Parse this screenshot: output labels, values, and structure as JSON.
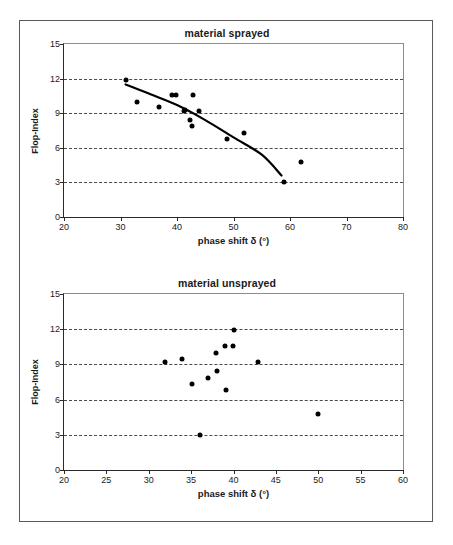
{
  "figure": {
    "charts": [
      {
        "id": "material-sprayed",
        "title": "material sprayed",
        "xlabel": "phase shift δ (°)",
        "ylabel": "Flop-Index",
        "xlim": [
          20,
          80
        ],
        "ylim": [
          0,
          15
        ],
        "xticks": [
          "20",
          "30",
          "40",
          "50",
          "60",
          "70",
          "80"
        ],
        "xtick_values": [
          20,
          30,
          40,
          50,
          60,
          70,
          80
        ],
        "yticks": [
          "0",
          "3",
          "6",
          "9",
          "12",
          "15"
        ],
        "ytick_values": [
          0,
          3,
          6,
          9,
          12,
          15
        ],
        "gridlines": [
          3,
          6,
          9,
          12
        ],
        "grid": "horizontal-dashed",
        "legend": "none",
        "points": [
          [
            30.9,
            11.9
          ],
          [
            33.0,
            9.95
          ],
          [
            36.9,
            9.5
          ],
          [
            39.1,
            10.6
          ],
          [
            39.9,
            10.55
          ],
          [
            41.2,
            9.2
          ],
          [
            41.4,
            9.25
          ],
          [
            42.3,
            8.4
          ],
          [
            42.7,
            7.85
          ],
          [
            42.9,
            10.55
          ],
          [
            43.9,
            9.2
          ],
          [
            48.9,
            6.8
          ],
          [
            51.9,
            7.3
          ],
          [
            59.0,
            3.0
          ],
          [
            61.9,
            4.75
          ]
        ],
        "trend": {
          "type": "fitted-curve",
          "points": [
            [
              30.9,
              11.5
            ],
            [
              35.0,
              10.7
            ],
            [
              40.0,
              9.7
            ],
            [
              45.0,
              8.4
            ],
            [
              50.0,
              6.9
            ],
            [
              55.0,
              5.4
            ],
            [
              58.5,
              3.6
            ]
          ]
        }
      },
      {
        "id": "material-unsprayed",
        "title": "material unsprayed",
        "xlabel": "phase shift δ (°)",
        "ylabel": "Flop-Index",
        "xlim": [
          20,
          60
        ],
        "ylim": [
          0,
          15
        ],
        "xticks": [
          "20",
          "25",
          "30",
          "35",
          "40",
          "45",
          "50",
          "55",
          "60"
        ],
        "xtick_values": [
          20,
          25,
          30,
          35,
          40,
          45,
          50,
          55,
          60
        ],
        "yticks": [
          "0",
          "3",
          "6",
          "9",
          "12",
          "15"
        ],
        "ytick_values": [
          0,
          3,
          6,
          9,
          12,
          15
        ],
        "gridlines": [
          3,
          6,
          9,
          12
        ],
        "grid": "horizontal-dashed",
        "legend": "none",
        "points": [
          [
            31.9,
            9.2
          ],
          [
            33.9,
            9.5
          ],
          [
            35.1,
            7.35
          ],
          [
            36.0,
            3.0
          ],
          [
            37.0,
            7.85
          ],
          [
            37.9,
            9.95
          ],
          [
            38.1,
            8.4
          ],
          [
            39.0,
            10.6
          ],
          [
            39.1,
            6.8
          ],
          [
            39.9,
            10.55
          ],
          [
            40.0,
            11.9
          ],
          [
            42.9,
            9.2
          ],
          [
            50.0,
            4.75
          ]
        ],
        "trend": null
      }
    ]
  },
  "chart_data": [
    {
      "type": "scatter",
      "title": "material sprayed",
      "xlabel": "phase shift δ (°)",
      "ylabel": "Flop-Index",
      "xlim": [
        20,
        80
      ],
      "ylim": [
        0,
        15
      ],
      "xticks": [
        20,
        30,
        40,
        50,
        60,
        70,
        80
      ],
      "yticks": [
        0,
        3,
        6,
        9,
        12,
        15
      ],
      "grid": "horizontal dashed at 3,6,9,12",
      "legend": "none",
      "series": [
        {
          "name": "sprayed samples",
          "x": [
            30.9,
            33.0,
            36.9,
            39.1,
            39.9,
            41.2,
            41.4,
            42.3,
            42.7,
            42.9,
            43.9,
            48.9,
            51.9,
            59.0,
            61.9
          ],
          "y": [
            11.9,
            9.95,
            9.5,
            10.6,
            10.55,
            9.2,
            9.25,
            8.4,
            7.85,
            10.55,
            9.2,
            6.8,
            7.3,
            3.0,
            4.75
          ]
        },
        {
          "name": "fitted trend curve",
          "type": "line",
          "x": [
            30.9,
            35.0,
            40.0,
            45.0,
            50.0,
            55.0,
            58.5
          ],
          "y": [
            11.5,
            10.7,
            9.7,
            8.4,
            6.9,
            5.4,
            3.6
          ]
        }
      ]
    },
    {
      "type": "scatter",
      "title": "material unsprayed",
      "xlabel": "phase shift δ (°)",
      "ylabel": "Flop-Index",
      "xlim": [
        20,
        60
      ],
      "ylim": [
        0,
        15
      ],
      "xticks": [
        20,
        25,
        30,
        35,
        40,
        45,
        50,
        55,
        60
      ],
      "yticks": [
        0,
        3,
        6,
        9,
        12,
        15
      ],
      "grid": "horizontal dashed at 3,6,9,12",
      "legend": "none",
      "series": [
        {
          "name": "unsprayed samples",
          "x": [
            31.9,
            33.9,
            35.1,
            36.0,
            37.0,
            37.9,
            38.1,
            39.0,
            39.1,
            39.9,
            40.0,
            42.9,
            50.0
          ],
          "y": [
            9.2,
            9.5,
            7.35,
            3.0,
            7.85,
            9.95,
            8.4,
            10.6,
            6.8,
            10.55,
            11.9,
            9.2,
            4.75
          ]
        }
      ]
    }
  ]
}
